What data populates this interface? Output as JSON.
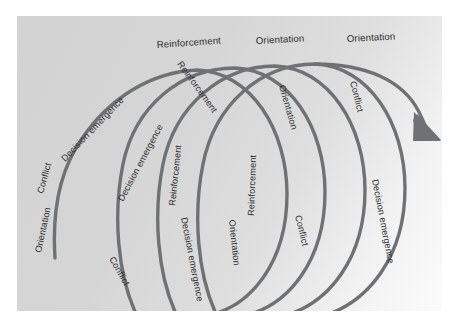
{
  "figure": {
    "type": "spiral-model-diagram",
    "panel_background": "#d4d4d4",
    "curve_color": "#6e7275",
    "label_color": "#2b2b2b",
    "phases": [
      "Orientation",
      "Conflict",
      "Decision emergence",
      "Reinforcement"
    ],
    "cycles": 4,
    "arrow_direction": "down-right"
  },
  "labels": {
    "tail_orientation": "Orientation",
    "tail_conflict": "Conflict",
    "cycle1_decision_emergence": "Decision emergence",
    "cycle1_reinforcement_top": "Reinforcement",
    "cycle1_reinforcement_inner": "Reinforcement",
    "cycle2_orientation_top": "Orientation",
    "cycle2_orientation_inner": "Orientation",
    "cycle3_orientation_top": "Orientation",
    "cycle2_conflict": "Conflict",
    "cycle1_conflict": "Conflict",
    "cycle2_decision_emergence": "Decision emergence",
    "cycle2_decision_emergence_bottom": "Decision emergence",
    "cycle2_reinforcement": "Reinforcement",
    "cycle3_reinforcement": "Reinforcement",
    "cycle3_orientation": "Orientation",
    "cycle3_orientation_bottom": "Orientation",
    "cycle3_conflict": "Conflict",
    "cycle4_conflict": "Conflict",
    "cycle4_decision_emergence": "Decision emergence"
  }
}
